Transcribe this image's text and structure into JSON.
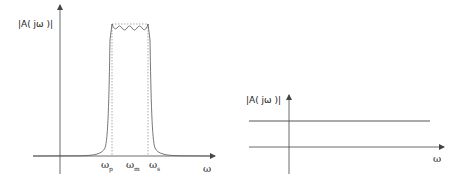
{
  "left_plot": {
    "ylabel": "|A( jω )|",
    "xlabel": "ω",
    "ticks": [
      {
        "base": "ω",
        "sub": "p"
      },
      {
        "base": "ω",
        "sub": "m"
      },
      {
        "base": "ω",
        "sub": "s"
      }
    ],
    "description": "Band-pass magnitude response with passband ripple between ωp and ωs, ideal response shown dotted"
  },
  "right_plot": {
    "ylabel": "|A( jω )|",
    "xlabel": "ω",
    "description": "Constant (all-pass) magnitude response"
  },
  "colors": {
    "axis": "#444444",
    "curve": "#555555",
    "ideal": "#888888"
  }
}
